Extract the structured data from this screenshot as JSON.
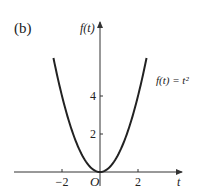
{
  "panel_label": "(b)",
  "chart_data": {
    "type": "line",
    "title": "",
    "function": "f(t) = t^2",
    "xlabel": "t",
    "ylabel": "f(t)",
    "origin_label": "O",
    "annotation": "f(t) = t²",
    "x_ticks": [
      {
        "value": -2,
        "label": "−2"
      },
      {
        "value": 2,
        "label": "2"
      }
    ],
    "y_ticks": [
      {
        "value": 2,
        "label": "2"
      },
      {
        "value": 4,
        "label": "4"
      }
    ],
    "xlim": [
      -3.1,
      3.3
    ],
    "ylim": [
      -1.0,
      6.8
    ],
    "curve_t_range": [
      -2.45,
      2.45
    ],
    "series": [
      {
        "name": "f(t) = t^2",
        "x": [
          -2.45,
          -2,
          -1.5,
          -1,
          -0.5,
          0,
          0.5,
          1,
          1.5,
          2,
          2.45
        ],
        "y": [
          6.0,
          4,
          2.25,
          1,
          0.25,
          0,
          0.25,
          1,
          2.25,
          4,
          6.0
        ]
      }
    ],
    "grid": false,
    "legend": "none"
  },
  "style": {
    "axis_color": "#333333",
    "curve_color": "#222222"
  }
}
